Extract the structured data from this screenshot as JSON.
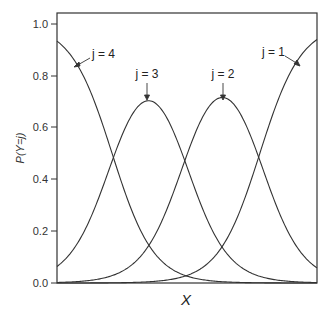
{
  "chart_data": {
    "type": "line",
    "title": "",
    "xlabel": "X",
    "ylabel": "P(Y=j)",
    "ylim": [
      0,
      1.0
    ],
    "xlim": [
      0,
      10
    ],
    "yticks": [
      "0.0",
      "0.2",
      "0.4",
      "0.6",
      "0.8",
      "1.0"
    ],
    "xticks": [],
    "grid": false,
    "legend": "none (inline annotations with arrows)",
    "model": "ordinal logistic category probabilities",
    "series": [
      {
        "name": "j=1",
        "x": [
          0,
          2,
          4,
          6,
          7.8,
          9,
          10
        ],
        "values": [
          0.0,
          0.01,
          0.06,
          0.2,
          0.5,
          0.8,
          0.92
        ]
      },
      {
        "name": "j=2",
        "x": [
          0,
          2,
          4.9,
          6.35,
          7.8,
          9,
          10
        ],
        "values": [
          0.0,
          0.03,
          0.5,
          0.71,
          0.5,
          0.17,
          0.06
        ]
      },
      {
        "name": "j=3",
        "x": [
          0,
          2.1,
          3.5,
          4.9,
          7,
          9,
          10
        ],
        "values": [
          0.07,
          0.5,
          0.71,
          0.5,
          0.07,
          0.01,
          0.0
        ]
      },
      {
        "name": "j=4",
        "x": [
          0,
          1,
          2.1,
          3,
          4,
          6,
          10
        ],
        "values": [
          0.93,
          0.8,
          0.5,
          0.25,
          0.09,
          0.01,
          0.0
        ]
      }
    ],
    "annotations": [
      {
        "text": "j = 4",
        "target_series": "j=4"
      },
      {
        "text": "j = 3",
        "target_series": "j=3"
      },
      {
        "text": "j = 2",
        "target_series": "j=2"
      },
      {
        "text": "j = 1",
        "target_series": "j=1"
      }
    ]
  },
  "labels": {
    "ylabel": "P(Y=j)",
    "xlabel": "X",
    "yticks": [
      "0.0",
      "0.2",
      "0.4",
      "0.6",
      "0.8",
      "1.0"
    ],
    "ann_j4": "j = 4",
    "ann_j3": "j = 3",
    "ann_j2": "j = 2",
    "ann_j1": "j = 1"
  },
  "colors": {
    "line": "#333333",
    "frame": "#333333"
  }
}
